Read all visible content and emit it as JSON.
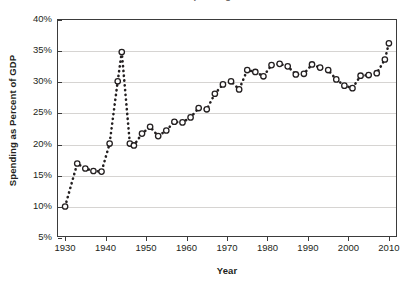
{
  "chart_data": {
    "type": "line",
    "title": "Government Spending as a Percent of GDP",
    "xlabel": "Year",
    "ylabel": "Spending as Percent of GDP",
    "xlim": [
      1928,
      2012
    ],
    "ylim": [
      5,
      40
    ],
    "xticks": [
      "1930",
      "1940",
      "1950",
      "1960",
      "1970",
      "1980",
      "1990",
      "2000",
      "2010"
    ],
    "xtick_values": [
      1930,
      1940,
      1950,
      1960,
      1970,
      1980,
      1990,
      2000,
      2010
    ],
    "yticks": [
      "5%",
      "10%",
      "15%",
      "20%",
      "25%",
      "30%",
      "35%",
      "40%"
    ],
    "ytick_values": [
      5,
      10,
      15,
      20,
      25,
      30,
      35,
      40
    ],
    "grid": "horizontal",
    "legend": "none",
    "marker": "open-circle",
    "line_style": "dotted",
    "line_color": "#231f20",
    "x": [
      1930,
      1933,
      1935,
      1937,
      1939,
      1941,
      1943,
      1944,
      1946,
      1947,
      1949,
      1951,
      1953,
      1955,
      1957,
      1959,
      1961,
      1963,
      1965,
      1967,
      1969,
      1971,
      1973,
      1975,
      1977,
      1979,
      1981,
      1983,
      1985,
      1987,
      1989,
      1991,
      1993,
      1995,
      1997,
      1999,
      2001,
      2003,
      2005,
      2007,
      2009,
      2010
    ],
    "values": [
      9.9,
      16.8,
      16.0,
      15.6,
      15.5,
      20.0,
      30.0,
      34.7,
      20.0,
      19.7,
      21.6,
      22.7,
      21.2,
      22.1,
      23.5,
      23.4,
      24.2,
      25.7,
      25.5,
      28.0,
      29.5,
      30.0,
      28.7,
      31.8,
      31.5,
      30.8,
      32.6,
      32.8,
      32.4,
      31.1,
      31.2,
      32.7,
      32.2,
      31.8,
      30.3,
      29.3,
      28.9,
      30.9,
      31.0,
      31.3,
      33.5,
      36.1
    ]
  }
}
